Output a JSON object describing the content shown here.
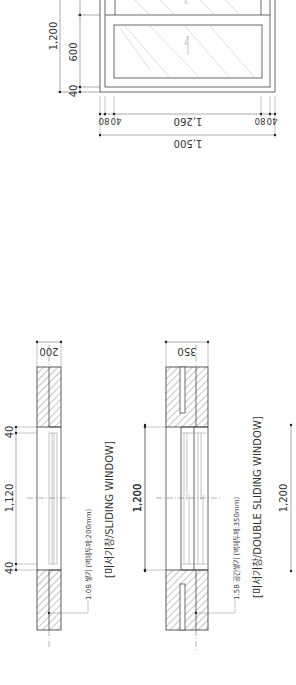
{
  "drawing": {
    "orientation": "rotated-90-ccw",
    "elevation": {
      "dims_vertical": [
        "1,200",
        "600",
        "40"
      ],
      "dims_horizontal_top": [
        "40",
        "80",
        "1,260",
        "80",
        "40"
      ],
      "dims_horizontal_total": "1,500"
    },
    "plan_sliding": {
      "wall_thickness": "200",
      "dims": [
        "40",
        "1,120",
        "40"
      ],
      "overall_opening": "1,200",
      "note": "1.0B 쌓기 (벽체두께:200mm)",
      "title": "[미서기창/SLIDING WINDOW]"
    },
    "plan_double_sliding": {
      "wall_thickness": "350",
      "opening": "1,200",
      "overall_opening": "1,200",
      "note": "1.5B 공간쌓기 (벽체두께:350mm)",
      "title": "[미서기창/DOUBLE SLIDING WINDOW]"
    }
  }
}
